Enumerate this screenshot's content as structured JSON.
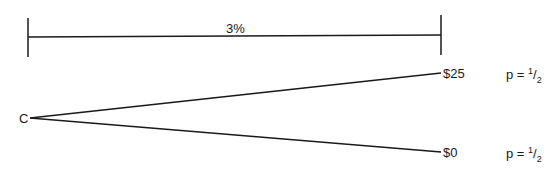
{
  "time_bar": {
    "label": "3%"
  },
  "origin": {
    "label": "C"
  },
  "outcomes": [
    {
      "value": "$25",
      "prob_prefix": "p = ",
      "prob_num": "1",
      "prob_den": "2"
    },
    {
      "value": "$0",
      "prob_prefix": "p = ",
      "prob_num": "1",
      "prob_den": "2"
    }
  ],
  "colors": {
    "line": "#1a1a1a",
    "background": "#ffffff"
  }
}
